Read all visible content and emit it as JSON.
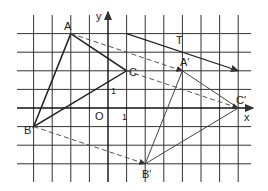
{
  "diagram": {
    "type": "translation",
    "axes": {
      "x_label": "x",
      "y_label": "y",
      "origin_label": "O",
      "unit_x_label": "1",
      "unit_y_label": "1"
    },
    "grid": {
      "x_min": -5,
      "x_max": 8,
      "y_min": -4,
      "y_max": 5
    },
    "original_triangle": {
      "A": {
        "label": "A",
        "x": -2,
        "y": 4
      },
      "B": {
        "label": "B",
        "x": -4,
        "y": -1
      },
      "C": {
        "label": "C",
        "x": 1,
        "y": 2
      }
    },
    "image_triangle": {
      "A": {
        "label": "A′",
        "x": 4,
        "y": 2
      },
      "B": {
        "label": "B′",
        "x": 2,
        "y": -3
      },
      "C": {
        "label": "C′",
        "x": 7,
        "y": 0
      }
    },
    "vector": {
      "label": "T",
      "from": [
        1,
        4
      ],
      "to": [
        7,
        2
      ],
      "components": [
        6,
        -2
      ]
    },
    "colors": {
      "lines": "#222222",
      "grid": "#333333",
      "dashed": "#555555"
    }
  }
}
